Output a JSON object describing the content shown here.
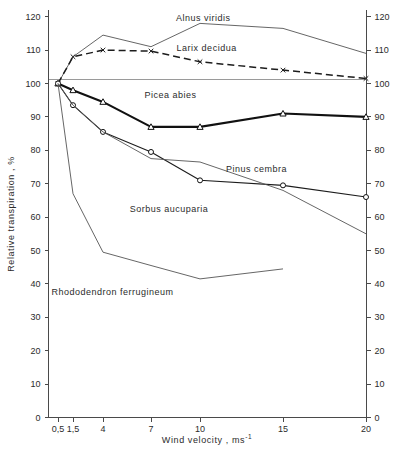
{
  "chart_data": {
    "type": "line",
    "title": "",
    "xlabel": "Wind velocity , ms⁻¹",
    "ylabel": "Relative transpiration , %",
    "xlabel_main": "Wind velocity ,  ms",
    "xlabel_exponent": "-1",
    "x_tick_labels": [
      "0,5",
      "1,5",
      "4",
      "7",
      "10",
      "15",
      "20"
    ],
    "x_tick_values": [
      0.5,
      1.5,
      4,
      7,
      10,
      15,
      20
    ],
    "y_tick_labels": [
      "0",
      "10",
      "20",
      "30",
      "40",
      "50",
      "60",
      "70",
      "80",
      "90",
      "100",
      "110",
      "120"
    ],
    "y_tick_values": [
      0,
      10,
      20,
      30,
      40,
      50,
      60,
      70,
      80,
      90,
      100,
      110,
      120
    ],
    "ylim": [
      0,
      122
    ],
    "grid": false,
    "legend_position": "inline-labels",
    "reference_line": 100,
    "right_axis": true,
    "right_axis_labels": [
      "0",
      "10",
      "20",
      "30",
      "40",
      "50",
      "60",
      "70",
      "80",
      "90",
      "100",
      "110",
      "120"
    ],
    "categories": [
      0.5,
      1.5,
      4,
      7,
      10,
      15,
      20
    ],
    "series": [
      {
        "name": "Alnus viridis",
        "style": "thin-solid",
        "marker": "none",
        "values": [
          100,
          108,
          114.5,
          111,
          118,
          116.5,
          109
        ],
        "label_x": 10.2,
        "label_y": 119.5
      },
      {
        "name": "Larix decidua",
        "style": "dashed",
        "marker": "x",
        "values": [
          100,
          108,
          110,
          109.7,
          106.5,
          104,
          101.5
        ],
        "label_x": 10.4,
        "label_y": 110.5
      },
      {
        "name": "Picea abies",
        "style": "thick-solid",
        "marker": "triangle",
        "values": [
          100,
          98,
          94.5,
          87,
          87,
          91,
          90
        ],
        "label_x": 8.2,
        "label_y": 96.5
      },
      {
        "name": "Pinus cembra",
        "style": "medium-solid",
        "marker": "circle",
        "values": [
          100,
          93.5,
          85.5,
          79.5,
          71,
          69.5,
          66
        ],
        "label_x": 13.4,
        "label_y": 74.5
      },
      {
        "name": "Sorbus aucuparia",
        "style": "thin-solid",
        "marker": "none",
        "values": [
          100,
          93.5,
          85.5,
          77.5,
          76.5,
          68,
          55
        ],
        "label_x": 8.1,
        "label_y": 62.5
      },
      {
        "name": "Rhododendron ferrugineum",
        "style": "thin-solid",
        "marker": "none",
        "values": [
          100,
          67,
          49.5,
          45.5,
          41.5,
          44.5,
          null
        ],
        "label_x": 4.6,
        "label_y": 37.5
      }
    ]
  }
}
